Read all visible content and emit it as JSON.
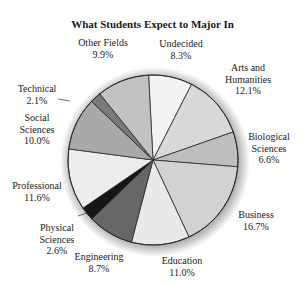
{
  "chart_data": {
    "type": "pie",
    "title": "What Students Expect to Major In",
    "categories": [
      "Undecided",
      "Arts and Humanities",
      "Biological Sciences",
      "Business",
      "Education",
      "Engineering",
      "Physical Sciences",
      "Professional",
      "Social Sciences",
      "Technical",
      "Other Fields"
    ],
    "values": [
      8.3,
      12.1,
      6.6,
      16.7,
      11.0,
      8.7,
      2.6,
      11.6,
      10.0,
      2.1,
      9.9
    ],
    "unit": "%",
    "start_angle_deg": -3,
    "direction": "clockwise",
    "colors": [
      "#f3f3f3",
      "#d9d9d9",
      "#bebebe",
      "#d2d2d2",
      "#e9e9e9",
      "#676767",
      "#151515",
      "#ededed",
      "#a9a9a9",
      "#7a7a7a",
      "#c2c2c2"
    ],
    "legend": "none (direct labels)"
  },
  "labels": [
    {
      "lines": [
        "Undecided",
        "8.3%"
      ],
      "x": 181,
      "y": 38
    },
    {
      "lines": [
        "Arts and",
        "Humanities",
        "12.1%"
      ],
      "x": 248,
      "y": 62
    },
    {
      "lines": [
        "Biological",
        "Sciences",
        "6.6%"
      ],
      "x": 269,
      "y": 131
    },
    {
      "lines": [
        "Business",
        "16.7%"
      ],
      "x": 256,
      "y": 209
    },
    {
      "lines": [
        "Education",
        "11.0%"
      ],
      "x": 182,
      "y": 255
    },
    {
      "lines": [
        "Engineering",
        "8.7%"
      ],
      "x": 99,
      "y": 251
    },
    {
      "lines": [
        "Physical",
        "Sciences",
        "2.6%"
      ],
      "x": 57,
      "y": 222
    },
    {
      "lines": [
        "Professional",
        "11.6%"
      ],
      "x": 37,
      "y": 180
    },
    {
      "lines": [
        "Social",
        "Sciences",
        "10.0%"
      ],
      "x": 37,
      "y": 112
    },
    {
      "lines": [
        "Technical",
        "2.1%"
      ],
      "x": 37,
      "y": 83
    },
    {
      "lines": [
        "Other Fields",
        "9.9%"
      ],
      "x": 103,
      "y": 37
    }
  ]
}
